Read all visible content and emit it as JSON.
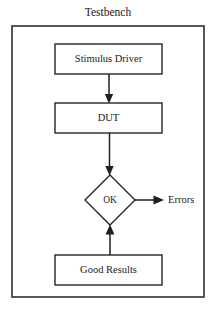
{
  "diagram": {
    "title": "Testbench",
    "container": {
      "name": "testbench-container",
      "x": 12,
      "y": 26,
      "width": 192,
      "height": 271
    },
    "nodes": [
      {
        "id": "stimulus-driver",
        "label": "Stimulus Driver",
        "shape": "rectangle",
        "x": 55,
        "y": 44,
        "width": 107,
        "height": 30,
        "cx": 108.5,
        "cy": 59
      },
      {
        "id": "dut",
        "label": "DUT",
        "shape": "rectangle",
        "x": 55,
        "y": 103,
        "width": 107,
        "height": 30,
        "cx": 108.5,
        "cy": 118
      },
      {
        "id": "ok-decision",
        "label": "OK",
        "shape": "diamond",
        "cx": 110,
        "cy": 200,
        "rx": 25,
        "ry": 25
      },
      {
        "id": "good-results",
        "label": "Good Results",
        "shape": "rectangle",
        "x": 55,
        "y": 255,
        "width": 107,
        "height": 30,
        "cx": 108.5,
        "cy": 270
      }
    ],
    "side_labels": [
      {
        "id": "errors-label",
        "label": "Errors",
        "x": 168,
        "y": 200
      }
    ],
    "edges": [
      {
        "id": "edge-stimulus-to-dut",
        "from": "stimulus-driver",
        "to": "dut",
        "direction": "down",
        "path": "M 109 74 L 109 101",
        "arrow": "M 109 103.5 L 105 94.5 L 113 94.5 Z"
      },
      {
        "id": "edge-dut-to-ok",
        "from": "dut",
        "to": "ok-decision",
        "direction": "down",
        "path": "M 109.5 133 L 109.5 172",
        "arrow": "M 109.5 175.5 L 105.5 166 L 113.5 166 Z"
      },
      {
        "id": "edge-ok-to-errors",
        "from": "ok-decision",
        "to": "errors-label",
        "direction": "right",
        "path": "M 135 200 L 160 200",
        "arrow": "M 164 200 L 154 195.5 L 154 204.5 Z"
      },
      {
        "id": "edge-good-results-to-ok",
        "from": "good-results",
        "to": "ok-decision",
        "direction": "up",
        "path": "M 110 255 L 110 229",
        "arrow": "M 110 224.5 L 105.8 234 L 114.2 234 Z"
      }
    ],
    "colors": {
      "background": "#ffffff",
      "stroke": "#262626",
      "container_stroke": "#2e2e2e",
      "connector": "#1f1f1f",
      "text": "#1a1a1a"
    }
  }
}
